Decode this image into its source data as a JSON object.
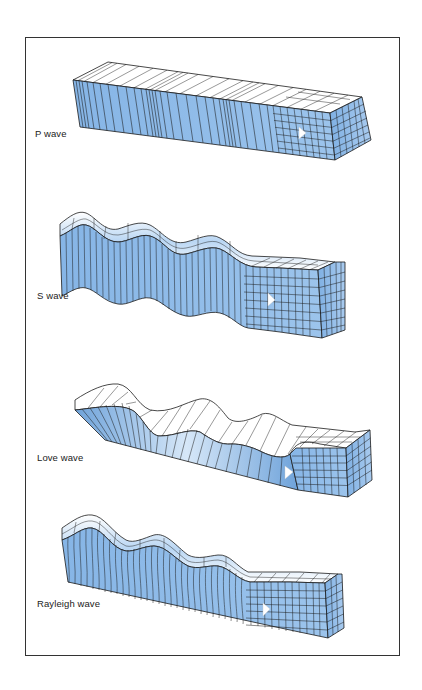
{
  "figure": {
    "panels": [
      {
        "id": "p-wave",
        "label": "P wave",
        "motion": "compressional"
      },
      {
        "id": "s-wave",
        "label": "S wave",
        "motion": "transverse vertical"
      },
      {
        "id": "love-wave",
        "label": "Love wave",
        "motion": "transverse horizontal"
      },
      {
        "id": "rayleigh-wave",
        "label": "Rayleigh wave",
        "motion": "rolling elliptical"
      }
    ],
    "colors": {
      "block_blue": "#8fbbe8",
      "block_blue_dark": "#6fa3da",
      "block_light": "#d8e8f7",
      "top_white": "#ffffff",
      "line": "#1a1a1a",
      "frame": "#333333"
    }
  }
}
